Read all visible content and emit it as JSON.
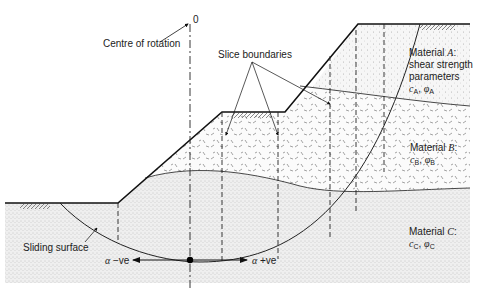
{
  "diagram": {
    "labels": {
      "origin": "0",
      "centre_of_rotation": "Centre of rotation",
      "slice_boundaries": "Slice boundaries",
      "sliding_surface": "Sliding surface",
      "alpha_negative": "−ve",
      "alpha_positive": "+ve",
      "alpha_symbol": "α"
    },
    "materials": [
      {
        "name": "Material ",
        "letter": "A",
        "line2": "shear strength",
        "line3": "parameters",
        "c": "c",
        "phi": "φ",
        "sub": "A"
      },
      {
        "name": "Material ",
        "letter": "B",
        "c": "c",
        "phi": "φ",
        "sub": "B"
      },
      {
        "name": "Material ",
        "letter": "C",
        "c": "c",
        "phi": "φ",
        "sub": "C"
      }
    ]
  }
}
